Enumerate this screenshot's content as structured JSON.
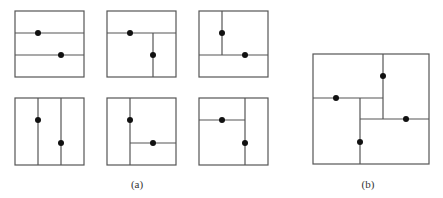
{
  "figure": {
    "stroke_color": "#555555",
    "dot_color": "#111111",
    "panels": [
      {
        "id": "a1",
        "rect": [
          15,
          11,
          69,
          66
        ],
        "lines": [
          [
            15,
            33,
            84,
            33
          ],
          [
            15,
            55,
            84,
            55
          ]
        ],
        "dots": [
          [
            38,
            33
          ],
          [
            61,
            55
          ]
        ]
      },
      {
        "id": "a2",
        "rect": [
          107,
          11,
          69,
          66
        ],
        "lines": [
          [
            107,
            33,
            176,
            33
          ],
          [
            153,
            33,
            153,
            77
          ]
        ],
        "dots": [
          [
            130,
            33
          ],
          [
            153,
            55
          ]
        ]
      },
      {
        "id": "a3",
        "rect": [
          199,
          11,
          69,
          66
        ],
        "lines": [
          [
            222,
            11,
            222,
            55
          ],
          [
            199,
            55,
            268,
            55
          ]
        ],
        "dots": [
          [
            222,
            33
          ],
          [
            245,
            55
          ]
        ]
      },
      {
        "id": "a4",
        "rect": [
          15,
          98,
          69,
          67
        ],
        "lines": [
          [
            38,
            98,
            38,
            165
          ],
          [
            61,
            98,
            61,
            165
          ]
        ],
        "dots": [
          [
            38,
            120
          ],
          [
            61,
            143
          ]
        ]
      },
      {
        "id": "a5",
        "rect": [
          107,
          98,
          69,
          67
        ],
        "lines": [
          [
            130,
            98,
            130,
            165
          ],
          [
            130,
            143,
            176,
            143
          ]
        ],
        "dots": [
          [
            130,
            120
          ],
          [
            153,
            143
          ]
        ]
      },
      {
        "id": "a6",
        "rect": [
          199,
          98,
          69,
          67
        ],
        "lines": [
          [
            245,
            98,
            245,
            165
          ],
          [
            199,
            120,
            245,
            120
          ]
        ],
        "dots": [
          [
            222,
            120
          ],
          [
            245,
            143
          ]
        ]
      },
      {
        "id": "b",
        "rect": [
          313,
          54,
          116,
          110
        ],
        "lines": [
          [
            313,
            98,
            383,
            98
          ],
          [
            383,
            54,
            383,
            119
          ],
          [
            360,
            119,
            429,
            119
          ],
          [
            360,
            98,
            360,
            164
          ]
        ],
        "dots": [
          [
            336,
            98
          ],
          [
            383,
            76
          ],
          [
            406,
            119
          ],
          [
            360,
            142
          ]
        ]
      }
    ],
    "labels": [
      {
        "text": "(a)",
        "x": 137,
        "y": 184
      },
      {
        "text": "(b)",
        "x": 368,
        "y": 184
      }
    ]
  }
}
